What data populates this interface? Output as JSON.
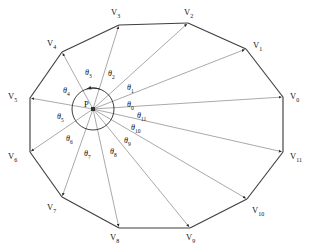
{
  "figure": {
    "type": "geometry-diagram",
    "center_label": "P",
    "colors": {
      "polygon_edge": "#3f3f3f",
      "ray": "#8c8c8c",
      "circle": "#2b2b2b",
      "text": "#111111",
      "background": "#ffffff"
    }
  },
  "vertices": [
    {
      "id": "v0",
      "label": "V",
      "sub": "0",
      "x": 283,
      "y": 97,
      "lx": 290,
      "ly": 92
    },
    {
      "id": "v1",
      "label": "V",
      "sub": "1",
      "x": 246,
      "y": 49,
      "lx": 253,
      "ly": 41
    },
    {
      "id": "v2",
      "label": "V",
      "sub": "2",
      "x": 188,
      "y": 23,
      "lx": 184,
      "ly": 8
    },
    {
      "id": "v3",
      "label": "V",
      "sub": "3",
      "x": 119,
      "y": 25,
      "lx": 111,
      "ly": 8
    },
    {
      "id": "v4",
      "label": "V",
      "sub": "4",
      "x": 62,
      "y": 52,
      "lx": 47,
      "ly": 39
    },
    {
      "id": "v5",
      "label": "V",
      "sub": "5",
      "x": 30,
      "y": 98,
      "lx": 8,
      "ly": 92
    },
    {
      "id": "v6",
      "label": "V",
      "sub": "6",
      "x": 30,
      "y": 152,
      "lx": 8,
      "ly": 152
    },
    {
      "id": "v7",
      "label": "V",
      "sub": "7",
      "x": 62,
      "y": 197,
      "lx": 47,
      "ly": 203
    },
    {
      "id": "v8",
      "label": "V",
      "sub": "8",
      "x": 119,
      "y": 228,
      "lx": 110,
      "ly": 233
    },
    {
      "id": "v9",
      "label": "V",
      "sub": "9",
      "x": 190,
      "y": 228,
      "lx": 186,
      "ly": 233
    },
    {
      "id": "v10",
      "label": "V",
      "sub": "10",
      "x": 247,
      "y": 199,
      "lx": 252,
      "ly": 206
    },
    {
      "id": "v11",
      "label": "V",
      "sub": "11",
      "x": 283,
      "y": 152,
      "lx": 290,
      "ly": 152
    }
  ],
  "center": {
    "x": 93,
    "y": 109,
    "radius": 21,
    "label": "P",
    "lx": 84,
    "ly": 100
  },
  "angles": [
    {
      "id": "theta0",
      "label": "θ",
      "sub": "0",
      "lx": 127,
      "ly": 101
    },
    {
      "id": "theta1",
      "label": "θ",
      "sub": "1",
      "lx": 127,
      "ly": 84
    },
    {
      "id": "theta2",
      "label": "θ",
      "sub": "2",
      "lx": 108,
      "ly": 70
    },
    {
      "id": "theta3",
      "label": "θ",
      "sub": "3",
      "lx": 85,
      "ly": 69
    },
    {
      "id": "theta4",
      "label": "θ",
      "sub": "4",
      "lx": 63,
      "ly": 87
    },
    {
      "id": "theta5",
      "label": "θ",
      "sub": "5",
      "lx": 57,
      "ly": 113
    },
    {
      "id": "theta6",
      "label": "θ",
      "sub": "6",
      "lx": 66,
      "ly": 135
    },
    {
      "id": "theta7",
      "label": "θ",
      "sub": "7",
      "lx": 84,
      "ly": 150
    },
    {
      "id": "theta8",
      "label": "θ",
      "sub": "8",
      "lx": 110,
      "ly": 148
    },
    {
      "id": "theta9",
      "label": "θ",
      "sub": "9",
      "lx": 124,
      "ly": 137
    },
    {
      "id": "theta10",
      "label": "θ",
      "sub": "10",
      "lx": 131,
      "ly": 124
    },
    {
      "id": "theta11",
      "label": "θ",
      "sub": "11",
      "lx": 137,
      "ly": 112
    }
  ],
  "chart_data": {
    "type": "diagram",
    "title": "",
    "vertex_count": 12,
    "angle_count": 12,
    "vertex_labels": [
      "V0",
      "V1",
      "V2",
      "V3",
      "V4",
      "V5",
      "V6",
      "V7",
      "V8",
      "V9",
      "V10",
      "V11"
    ],
    "angle_labels": [
      "θ0",
      "θ1",
      "θ2",
      "θ3",
      "θ4",
      "θ5",
      "θ6",
      "θ7",
      "θ8",
      "θ9",
      "θ10",
      "θ11"
    ],
    "center_label": "P"
  }
}
